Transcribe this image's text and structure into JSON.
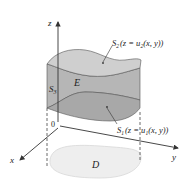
{
  "figure": {
    "axes": {
      "z_label": "z",
      "y_label": "y",
      "x_label": "x",
      "origin_label": "0"
    },
    "surfaces": {
      "top": {
        "name": "S",
        "sub": "2",
        "eq_prefix": "(z = u",
        "eq_sub": "2",
        "eq_suffix": "(x, y))"
      },
      "bottom": {
        "name": "S",
        "sub": "1",
        "eq_prefix": "(z = u",
        "eq_sub": "1",
        "eq_suffix": "(x, y))"
      },
      "side": {
        "name": "S",
        "sub": "3"
      }
    },
    "solid_label": "E",
    "region_label": "D",
    "colors": {
      "top_surface": "#c8c8c8",
      "side_surface": "#b4b4b4",
      "bottom_surface": "#a6a6a6",
      "region": "#eeeeee",
      "lines": "#333333"
    }
  }
}
